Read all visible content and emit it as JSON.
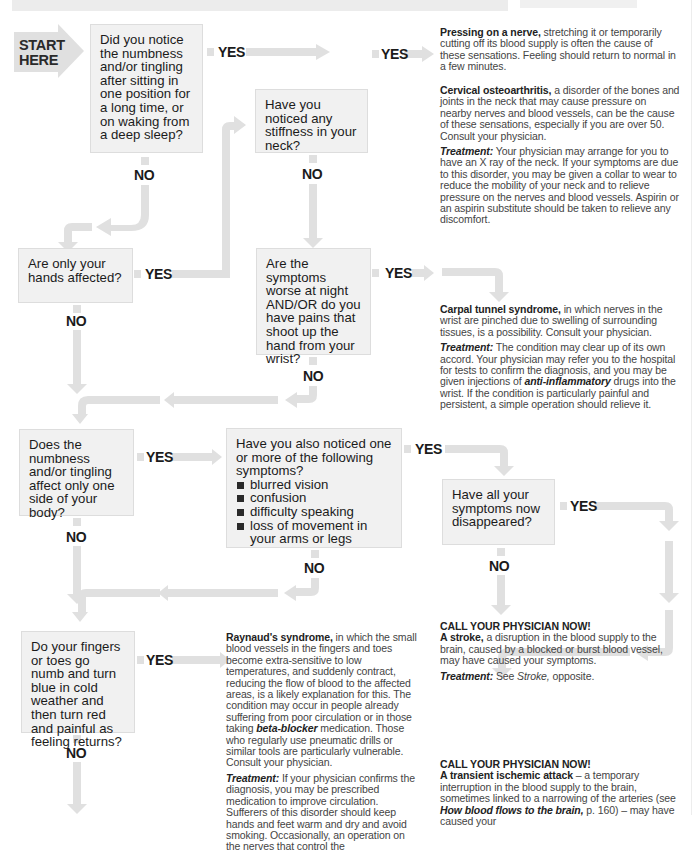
{
  "start": {
    "line1": "START",
    "line2": "HERE"
  },
  "questions": {
    "q1": "Did you notice the numbness and/or tingling after sitting in one position for a long time, or on waking from a deep sleep?",
    "q2": "Have you noticed any stiffness in your neck?",
    "q3": "Are only your hands affected?",
    "q4": "Are the symptoms worse at night AND/OR do you have pains that shoot up the hand from your wrist?",
    "q5": "Does the numbness and/or tingling affect only one side of your body?",
    "q6": {
      "intro": "Have you also noticed one or more of the following symptoms?",
      "items": [
        "blurred vision",
        "confusion",
        "difficulty speaking",
        "loss of movement in your arms or legs"
      ]
    },
    "q7": "Have all your symptoms now disappeared?",
    "q8": "Do your fingers or toes go numb and turn blue in cold weather and then turn red and painful as feeling returns?"
  },
  "labels": {
    "yes": "YES",
    "no": "NO"
  },
  "outcomes": {
    "nerve": {
      "title": "Pressing on a nerve,",
      "body": " stretching it or temporarily cutting off its blood supply is often the cause of these sensations. Feeling should return to normal in a few minutes."
    },
    "cervical": {
      "title": "Cervical osteoarthritis,",
      "body": " a disorder of the bones and joints in the neck that may cause pressure on nearby nerves and blood vessels, can be the cause of these sensations, especially if you are over 50. Consult your physician.",
      "treatment_label": "Treatment:",
      "treatment": " Your physician may arrange for you to have an X ray of the neck. If your symptoms are due to this disorder, you may be given a collar to wear to reduce the mobility of your neck and to relieve pressure on the nerves and blood vessels. Aspirin or an aspirin substitute should be taken to relieve any discomfort."
    },
    "carpal": {
      "title": "Carpal tunnel syndrome,",
      "body": " in which nerves in the wrist are pinched due to swelling of surrounding tissues, is a possibility. Consult your physician.",
      "treatment_label": "Treatment:",
      "treatment_a": " The condition may clear up of its own accord. Your physician may refer you to the hospital for tests to confirm the diagnosis, and you may be given injections of ",
      "treatment_em": "anti-inflammatory",
      "treatment_b": " drugs into the wrist. If the condition is particularly painful and persistent, a simple operation should relieve it."
    },
    "stroke": {
      "call": "CALL YOUR PHYSICIAN NOW!",
      "title": "A stroke,",
      "body": " a disruption in the blood supply to the brain, caused by a blocked or burst blood vessel, may have caused your symptoms.",
      "treatment_label": "Treatment:",
      "treatment_a": " See ",
      "treatment_em": "Stroke,",
      "treatment_b": " opposite."
    },
    "raynaud": {
      "title": "Raynaud's syndrome,",
      "body_a": " in which the small blood vessels in the fingers and toes become extra-sensitive to low temperatures, and suddenly contract, reducing the flow of blood to the affected areas, is a likely explanation for this. The condition may occur in people already suffering from poor circulation or in those taking ",
      "body_em": "beta-blocker",
      "body_b": " medication. Those who regularly use pneumatic drills or similar tools are particularly vulnerable. Consult your physician.",
      "treatment_label": "Treatment:",
      "treatment": " If your physician confirms the diagnosis, you may be prescribed medication to improve circulation. Sufferers of this disorder should keep hands and feet warm and dry and avoid smoking. Occasionally, an operation on the nerves that control the"
    },
    "tia": {
      "call": "CALL YOUR PHYSICIAN NOW!",
      "title": "A transient ischemic attack",
      "body_a": " – a temporary interruption in the blood supply to the brain, sometimes linked to a narrowing of the arteries (see ",
      "body_em": "How blood flows to the brain,",
      "body_b": " p. 160) – may have caused your"
    }
  },
  "colors": {
    "arrow": "#e0e0e0",
    "box_fill": "#f1f1f1",
    "start_fill": "#dcdcdc",
    "text": "#1b1b1b"
  }
}
